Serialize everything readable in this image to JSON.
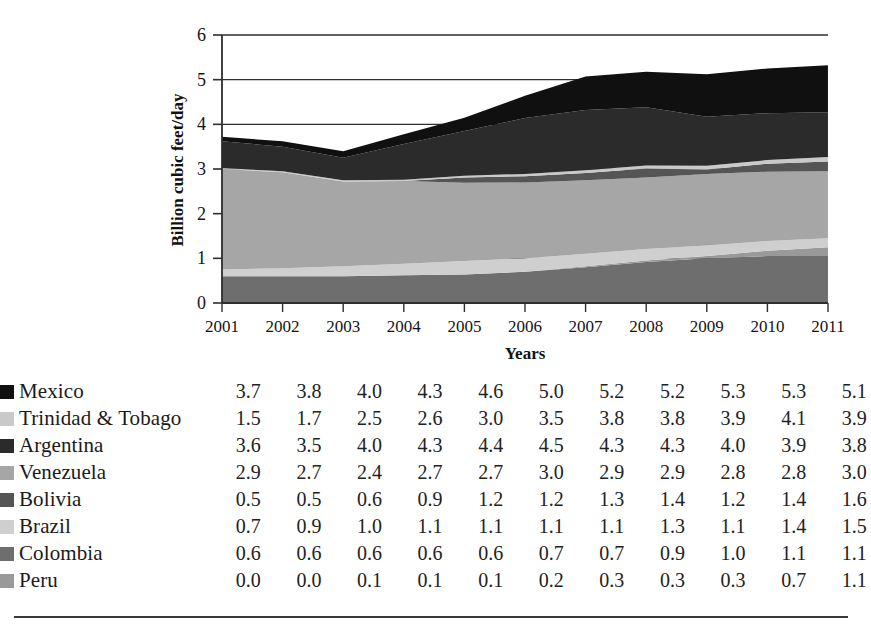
{
  "chart_data": {
    "type": "area",
    "stacked": true,
    "title": "",
    "xlabel": "Years",
    "ylabel": "Billion cubic feet/day",
    "categories": [
      "2001",
      "2002",
      "2003",
      "2004",
      "2005",
      "2006",
      "2007",
      "2008",
      "2009",
      "2010",
      "2011"
    ],
    "ylim": [
      0,
      6
    ],
    "yticks": [
      0,
      1,
      2,
      3,
      4,
      5,
      6
    ],
    "ytick_labels": [
      "0",
      "1",
      "2",
      "3",
      "4",
      "5",
      "6"
    ],
    "grid": true,
    "legend_position": "below-left",
    "plot_stack_order_bottom_to_top": [
      "Colombia",
      "Peru",
      "Brazil",
      "Venezuela",
      "Bolivia",
      "Trinidad & Tobago",
      "Argentina",
      "Mexico"
    ],
    "series": [
      {
        "name": "Mexico",
        "color": "#101010",
        "values": [
          3.7,
          3.8,
          4.0,
          4.3,
          4.6,
          5.0,
          5.2,
          5.2,
          5.3,
          5.3,
          5.1
        ],
        "plot_values": [
          0.1,
          0.12,
          0.15,
          0.22,
          0.3,
          0.5,
          0.75,
          0.8,
          0.95,
          1.0,
          1.05
        ]
      },
      {
        "name": "Trinidad & Tobago",
        "color": "#c9c9c9",
        "values": [
          1.5,
          1.7,
          2.5,
          2.6,
          3.0,
          3.5,
          3.8,
          3.8,
          3.9,
          4.1,
          3.9
        ],
        "plot_values": [
          0.02,
          0.02,
          0.03,
          0.03,
          0.04,
          0.05,
          0.06,
          0.07,
          0.08,
          0.08,
          0.1
        ]
      },
      {
        "name": "Argentina",
        "color": "#2b2b2b",
        "values": [
          3.6,
          3.5,
          4.0,
          4.3,
          4.4,
          4.5,
          4.3,
          4.3,
          4.0,
          3.9,
          3.8
        ],
        "plot_values": [
          0.6,
          0.55,
          0.5,
          0.8,
          1.0,
          1.25,
          1.35,
          1.3,
          1.1,
          1.05,
          1.0
        ]
      },
      {
        "name": "Venezuela",
        "color": "#a6a6a6",
        "values": [
          2.9,
          2.7,
          2.4,
          2.7,
          2.7,
          3.0,
          2.9,
          2.9,
          2.8,
          2.8,
          3.0
        ],
        "plot_values": [
          2.25,
          2.15,
          1.9,
          1.85,
          1.75,
          1.7,
          1.65,
          1.6,
          1.6,
          1.55,
          1.5
        ]
      },
      {
        "name": "Bolivia",
        "color": "#555555",
        "values": [
          0.5,
          0.5,
          0.6,
          0.9,
          1.2,
          1.2,
          1.3,
          1.4,
          1.2,
          1.4,
          1.6
        ],
        "plot_values": [
          0.0,
          0.0,
          0.0,
          0.0,
          0.12,
          0.14,
          0.16,
          0.2,
          0.1,
          0.18,
          0.22
        ]
      },
      {
        "name": "Brazil",
        "color": "#cfcfcf",
        "values": [
          0.7,
          0.9,
          1.0,
          1.1,
          1.1,
          1.1,
          1.1,
          1.3,
          1.1,
          1.4,
          1.5
        ],
        "plot_values": [
          0.15,
          0.18,
          0.22,
          0.26,
          0.3,
          0.3,
          0.28,
          0.26,
          0.24,
          0.22,
          0.2
        ]
      },
      {
        "name": "Colombia",
        "color": "#6e6e6e",
        "values": [
          0.6,
          0.6,
          0.6,
          0.6,
          0.6,
          0.7,
          0.7,
          0.9,
          1.0,
          1.1,
          1.1
        ],
        "plot_values": [
          0.6,
          0.6,
          0.6,
          0.62,
          0.64,
          0.7,
          0.8,
          0.92,
          1.0,
          1.05,
          1.05
        ]
      },
      {
        "name": "Peru",
        "color": "#999999",
        "values": [
          0.0,
          0.0,
          0.1,
          0.1,
          0.1,
          0.2,
          0.3,
          0.3,
          0.3,
          0.7,
          1.1
        ],
        "plot_values": [
          0.0,
          0.0,
          0.0,
          0.0,
          0.0,
          0.0,
          0.02,
          0.03,
          0.05,
          0.12,
          0.2
        ]
      }
    ]
  }
}
